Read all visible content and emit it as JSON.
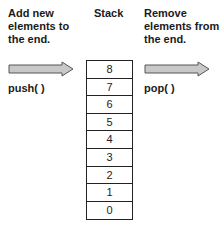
{
  "left_caption": {
    "lines": [
      "Add new",
      "elements to",
      "the end."
    ]
  },
  "stack_title": "Stack",
  "right_caption": {
    "lines": [
      "Remove",
      "elements from",
      "the end."
    ]
  },
  "operations": {
    "push": "push( )",
    "pop": "pop( )"
  },
  "stack": {
    "cells": [
      "8",
      "7",
      "6",
      "5",
      "4",
      "3",
      "2",
      "1",
      "0"
    ]
  },
  "colors": {
    "arrow_fill": "#c8c8c8",
    "arrow_stroke": "#555555",
    "text": "#1a1a1a",
    "border": "#222222"
  }
}
